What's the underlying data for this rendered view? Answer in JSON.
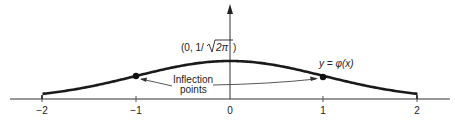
{
  "diagram": {
    "peak_label": "(0, 1/√2π)",
    "peak_label_parts": {
      "prefix": "(0, 1/",
      "radicand": "2π",
      "suffix": ")"
    },
    "curve_label": "y = φ(x)",
    "annotation": {
      "line1": "Inflection",
      "line2": "points"
    },
    "x_ticks": [
      {
        "value": -2,
        "label": "−2"
      },
      {
        "value": -1,
        "label": "−1"
      },
      {
        "value": 0,
        "label": "0"
      },
      {
        "value": 1,
        "label": "1"
      },
      {
        "value": 2,
        "label": "2"
      }
    ],
    "x_range": [
      -2,
      2
    ],
    "inflection_points": [
      -1,
      1
    ],
    "colors": {
      "curve": "#1a1a1a",
      "axis": "#333333",
      "text": "#222222",
      "arrow": "#444444"
    }
  }
}
